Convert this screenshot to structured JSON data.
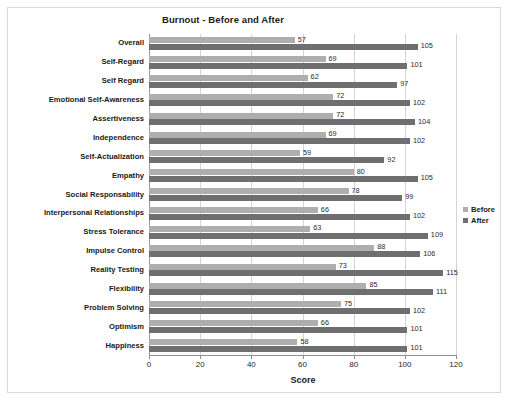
{
  "chart_data": {
    "type": "bar",
    "orientation": "horizontal",
    "title": "Burnout - Before and After",
    "xlabel": "Score",
    "ylabel": "",
    "xlim": [
      0,
      120
    ],
    "xticks": [
      0,
      20,
      40,
      60,
      80,
      100,
      120
    ],
    "grid": true,
    "legend_position": "right",
    "categories": [
      "Overall",
      "Self-Regard",
      "Self Regard",
      "Emotional Self-Awareness",
      "Assertiveness",
      "Independence",
      "Self-Actualization",
      "Empathy",
      "Social Responsability",
      "Interpersonal Relationships",
      "Stress Tolerance",
      "Impulse Control",
      "Reality Testing",
      "Flexibility",
      "Problem Solving",
      "Optimism",
      "Happiness"
    ],
    "series": [
      {
        "name": "Before",
        "color": "#aeaeae",
        "values": [
          57,
          69,
          62,
          72,
          72,
          69,
          59,
          80,
          78,
          66,
          63,
          88,
          73,
          85,
          75,
          66,
          58
        ]
      },
      {
        "name": "After",
        "color": "#6f6f6f",
        "values": [
          105,
          101,
          97,
          102,
          104,
          102,
          92,
          105,
          99,
          102,
          109,
          106,
          115,
          111,
          102,
          101,
          101
        ]
      }
    ]
  },
  "legend": {
    "items": [
      {
        "label": "Before"
      },
      {
        "label": "After"
      }
    ]
  }
}
